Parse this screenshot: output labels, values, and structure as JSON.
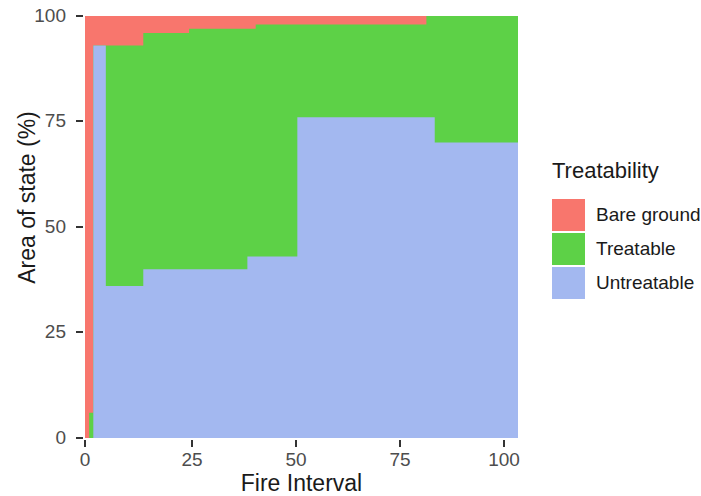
{
  "chart_data": {
    "type": "area",
    "title": "",
    "xlabel": "Fire Interval",
    "ylabel": "Area of state (%)",
    "xlim": [
      0,
      104
    ],
    "ylim": [
      0,
      100
    ],
    "grid": false,
    "stacked": true,
    "legend_position": "right",
    "legend_title": "Treatability",
    "xticks": [
      0,
      25,
      50,
      75,
      100
    ],
    "xtick_labels": [
      "0",
      "25",
      "50",
      "75",
      "100"
    ],
    "yticks": [
      0,
      25,
      50,
      75,
      100
    ],
    "ytick_labels": [
      "0",
      "25",
      "50",
      "75",
      "100"
    ],
    "series": [
      {
        "name": "Untreatable",
        "color": "#A3B8F0",
        "values": [
          0,
          0,
          93,
          93,
          36,
          36,
          40,
          40,
          43,
          43,
          76,
          76,
          76,
          70,
          70,
          70
        ]
      },
      {
        "name": "Treatable",
        "color": "#5DD147",
        "values": [
          0,
          6,
          5,
          5,
          57,
          57,
          55,
          55,
          53,
          53,
          21,
          21,
          22,
          28,
          30,
          30
        ]
      },
      {
        "name": "Bare ground",
        "color": "#F8766D",
        "values": [
          100,
          94,
          2,
          2,
          7,
          7,
          5,
          5,
          4,
          4,
          3,
          3,
          2,
          2,
          0,
          0
        ]
      }
    ],
    "x": [
      0,
      1,
      2,
      3,
      5,
      14,
      15,
      25,
      39,
      41,
      51,
      60,
      82,
      84,
      90,
      104
    ],
    "steps": {
      "untreatable_top": [
        {
          "x0": 0,
          "x1": 2,
          "y": 0
        },
        {
          "x0": 2,
          "x1": 5,
          "y": 93
        },
        {
          "x0": 5,
          "x1": 14,
          "y": 36
        },
        {
          "x0": 14,
          "x1": 39,
          "y": 40
        },
        {
          "x0": 39,
          "x1": 51,
          "y": 43
        },
        {
          "x0": 51,
          "x1": 84,
          "y": 76
        },
        {
          "x0": 84,
          "x1": 104,
          "y": 70
        }
      ],
      "treatable_top": [
        {
          "x0": 0,
          "x1": 1,
          "y": 0
        },
        {
          "x0": 1,
          "x1": 2,
          "y": 6
        },
        {
          "x0": 2,
          "x1": 14,
          "y": 93
        },
        {
          "x0": 14,
          "x1": 25,
          "y": 96
        },
        {
          "x0": 25,
          "x1": 41,
          "y": 97
        },
        {
          "x0": 41,
          "x1": 82,
          "y": 98
        },
        {
          "x0": 82,
          "x1": 104,
          "y": 100
        }
      ]
    },
    "annotations": []
  },
  "axes": {
    "x_title": "Fire Interval",
    "y_title": "Area of state (%)",
    "x_ticks": [
      {
        "label": "0",
        "value": 0
      },
      {
        "label": "25",
        "value": 25
      },
      {
        "label": "50",
        "value": 50
      },
      {
        "label": "75",
        "value": 75
      },
      {
        "label": "100",
        "value": 100
      }
    ],
    "y_ticks": [
      {
        "label": "0",
        "value": 0
      },
      {
        "label": "25",
        "value": 25
      },
      {
        "label": "50",
        "value": 50
      },
      {
        "label": "75",
        "value": 75
      },
      {
        "label": "100",
        "value": 100
      }
    ]
  },
  "legend": {
    "title": "Treatability",
    "items": [
      {
        "label": "Bare ground",
        "color": "#F8766D"
      },
      {
        "label": "Treatable",
        "color": "#5DD147"
      },
      {
        "label": "Untreatable",
        "color": "#A3B8F0"
      }
    ]
  }
}
